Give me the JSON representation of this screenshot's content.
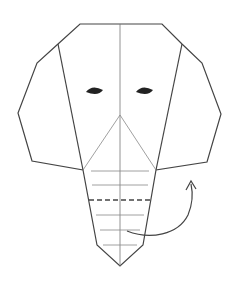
{
  "diagram": {
    "title": "Origami elephant face - fold trunk step",
    "colors": {
      "background": "#ffffff",
      "outline": "#444444",
      "crease": "#777777",
      "eye": "#222222",
      "dashed_fold": "#444444",
      "arrow": "#444444"
    },
    "outline_points": "80,24 162,24 182,44 202,63 221,114 207,162 156,170 143,245 120,266 97,245 83,170 32,161 18,113 37,63 58,44",
    "ear_fold_left": {
      "x1": 58,
      "y1": 44,
      "x2": 83,
      "y2": 170
    },
    "ear_fold_right": {
      "x1": 182,
      "y1": 44,
      "x2": 156,
      "y2": 170
    },
    "center_crease": {
      "x1": 120,
      "y1": 24,
      "x2": 120,
      "y2": 266
    },
    "nose_fold_left": {
      "x1": 120,
      "y1": 115,
      "x2": 83,
      "y2": 170
    },
    "nose_fold_right": {
      "x1": 120,
      "y1": 115,
      "x2": 156,
      "y2": 170
    },
    "trunk_pleats": [
      {
        "y": 171,
        "x1": 91,
        "x2": 149,
        "style": "solid"
      },
      {
        "y": 185,
        "x1": 92,
        "x2": 148,
        "style": "solid"
      },
      {
        "y": 200,
        "x1": 89,
        "x2": 151,
        "style": "dashed"
      },
      {
        "y": 215,
        "x1": 96,
        "x2": 144,
        "style": "solid"
      },
      {
        "y": 230,
        "x1": 100,
        "x2": 140,
        "style": "solid"
      },
      {
        "y": 245,
        "x1": 103,
        "x2": 137,
        "style": "solid"
      }
    ],
    "eyes": [
      {
        "name": "left-eye",
        "cx": 95,
        "cy": 91
      },
      {
        "name": "right-eye",
        "cx": 145,
        "cy": 91
      }
    ],
    "fold_arrow": {
      "path": "M127,231 C150,240 178,235 188,215 C193,203 193,193 191,184",
      "head": "186,190 191,181 196,189",
      "meaning": "fold trunk up"
    }
  }
}
